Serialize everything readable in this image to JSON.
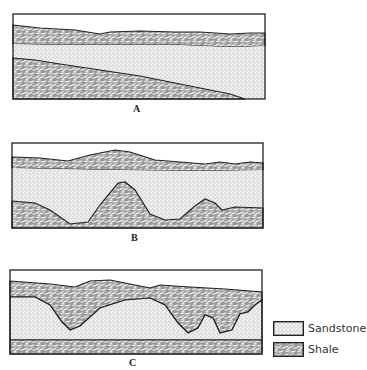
{
  "figure": {
    "panels": [
      {
        "id": "A",
        "label": "A",
        "description": "Shale overlying a wedge of sandstone that thickens to the right, resting on shale that dips right"
      },
      {
        "id": "B",
        "label": "B",
        "description": "Sandstone layer with irregular lower contact over undulating shale; thin shale cap above"
      },
      {
        "id": "C",
        "label": "C",
        "description": "Sandstone with irregular upper contact incised by shale channels; flat basal shale layer"
      }
    ],
    "legend": {
      "items": [
        {
          "name": "Sandstone",
          "pattern": "fine-dot-stipple",
          "color": "#e6e6e6"
        },
        {
          "name": "Shale",
          "pattern": "mottled-dash",
          "color": "#8a8a8a"
        }
      ]
    }
  },
  "colors": {
    "outline": "#222222",
    "sandstone": "#ececec",
    "shale_dark": "#8c8c8c",
    "shale_light": "#e2e2e2",
    "background": "#ffffff"
  }
}
